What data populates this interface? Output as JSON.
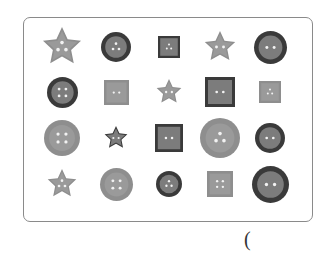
{
  "worksheet": {
    "answer_paren": "(",
    "colors": {
      "dark_ring": "#3a3a3a",
      "light_ring": "#8e8e8e",
      "face": "#7c7c7c",
      "face_light": "#9a9a9a",
      "hole": "#f2f2f2",
      "frame_border": "#8a8a8a"
    },
    "buttons": [
      {
        "row": 1,
        "col": 1,
        "shape": "star",
        "size": 40,
        "holes": 3,
        "rim": "light"
      },
      {
        "row": 1,
        "col": 2,
        "shape": "circle",
        "size": 30,
        "holes": 3,
        "rim": "dark"
      },
      {
        "row": 1,
        "col": 3,
        "shape": "square",
        "size": 22,
        "holes": 3,
        "rim": "dark"
      },
      {
        "row": 1,
        "col": 4,
        "shape": "star",
        "size": 32,
        "holes": 2,
        "rim": "light"
      },
      {
        "row": 1,
        "col": 5,
        "shape": "circle",
        "size": 33,
        "holes": 2,
        "rim": "dark"
      },
      {
        "row": 2,
        "col": 1,
        "shape": "circle",
        "size": 31,
        "holes": 4,
        "rim": "dark"
      },
      {
        "row": 2,
        "col": 2,
        "shape": "square",
        "size": 25,
        "holes": 2,
        "rim": "light"
      },
      {
        "row": 2,
        "col": 3,
        "shape": "star",
        "size": 26,
        "holes": 2,
        "rim": "light"
      },
      {
        "row": 2,
        "col": 4,
        "shape": "square",
        "size": 30,
        "holes": 2,
        "rim": "dark"
      },
      {
        "row": 2,
        "col": 5,
        "shape": "square",
        "size": 22,
        "holes": 3,
        "rim": "light"
      },
      {
        "row": 3,
        "col": 1,
        "shape": "circle",
        "size": 36,
        "holes": 4,
        "rim": "light"
      },
      {
        "row": 3,
        "col": 2,
        "shape": "star",
        "size": 24,
        "holes": 2,
        "rim": "dark"
      },
      {
        "row": 3,
        "col": 3,
        "shape": "square",
        "size": 28,
        "holes": 2,
        "rim": "dark"
      },
      {
        "row": 3,
        "col": 4,
        "shape": "circle",
        "size": 40,
        "holes": 3,
        "rim": "light"
      },
      {
        "row": 3,
        "col": 5,
        "shape": "circle",
        "size": 30,
        "holes": 2,
        "rim": "dark"
      },
      {
        "row": 4,
        "col": 1,
        "shape": "star",
        "size": 30,
        "holes": 3,
        "rim": "light"
      },
      {
        "row": 4,
        "col": 2,
        "shape": "circle",
        "size": 33,
        "holes": 4,
        "rim": "light"
      },
      {
        "row": 4,
        "col": 3,
        "shape": "circle",
        "size": 26,
        "holes": 3,
        "rim": "dark"
      },
      {
        "row": 4,
        "col": 4,
        "shape": "square",
        "size": 26,
        "holes": 4,
        "rim": "light"
      },
      {
        "row": 4,
        "col": 5,
        "shape": "circle",
        "size": 37,
        "holes": 2,
        "rim": "dark"
      }
    ],
    "row_centers_y": [
      47,
      92,
      138,
      184
    ],
    "col_centers_x": [
      62,
      116,
      169,
      220,
      270
    ]
  }
}
